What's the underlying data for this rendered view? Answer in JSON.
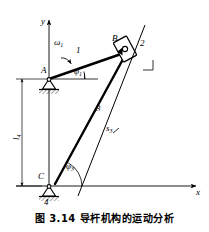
{
  "figure": {
    "caption": "图 3.14  导杆机构的运动分析",
    "caption_number": "图 3.14",
    "caption_title": "导杆机构的运动分析",
    "background_color": "#ffffff",
    "line_color": "#000000"
  },
  "axes": {
    "y_label": "y",
    "x_label": "x"
  },
  "joints": [
    {
      "id": "A",
      "label": "A",
      "type": "fixed-pivot"
    },
    {
      "id": "B",
      "label": "B",
      "type": "slider-pin"
    },
    {
      "id": "C",
      "label": "C",
      "type": "fixed-pivot"
    }
  ],
  "links": [
    {
      "id": "1",
      "label": "1",
      "name": "crank"
    },
    {
      "id": "2",
      "label": "2",
      "name": "slider-block"
    },
    {
      "id": "3",
      "label": "3",
      "name": "guide-bar"
    },
    {
      "id": "4",
      "label": "4",
      "name": "ground"
    }
  ],
  "annotations": {
    "omega1": "ω",
    "omega1_sub": "1",
    "phi1": "φ",
    "phi1_sub": "1",
    "phi3": "φ",
    "phi3_sub": "3",
    "s3": "s",
    "s3_sub": "3",
    "l4": "l",
    "l4_sub": "4"
  }
}
